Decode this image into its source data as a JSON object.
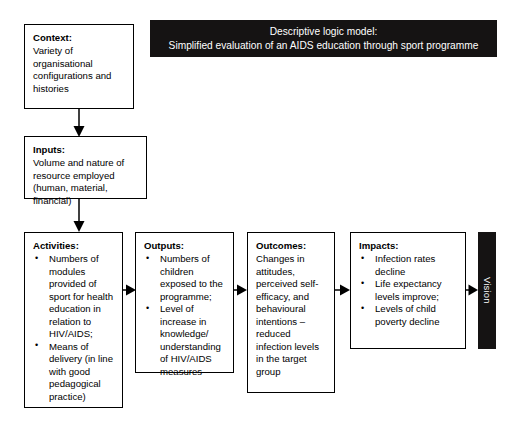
{
  "banner": {
    "line1": "Descriptive logic model:",
    "line2": "Simplified evaluation of an AIDS education through sport programme",
    "background_color": "#151313",
    "text_color": "#ffffff"
  },
  "nodes": {
    "context": {
      "heading": "Context:",
      "body": "Variety of organisational configurations and histories"
    },
    "inputs": {
      "heading": "Inputs:",
      "body": "Volume and nature of resource employed (human, material, financial)"
    },
    "activities": {
      "heading": "Activities:",
      "bullets": [
        "Numbers of modules provided of sport for health education in relation to HIV/AIDS;",
        "Means of delivery (in line with good pedagogical practice)"
      ]
    },
    "outputs": {
      "heading": "Outputs:",
      "bullets": [
        "Numbers of children exposed to the programme;",
        "Level of increase in knowledge/ understanding of HIV/AIDS measures"
      ]
    },
    "outcomes": {
      "heading": "Outcomes:",
      "body": "Changes in attitudes, perceived self-efficacy, and behavioural intentions – reduced infection levels in the target group"
    },
    "impacts": {
      "heading": "Impacts:",
      "bullets": [
        "Infection rates decline",
        "Life expectancy levels improve;",
        "Levels of child poverty decline"
      ]
    },
    "vision": {
      "label": "Vision",
      "background_color": "#151313",
      "text_color": "#ffffff"
    }
  },
  "bullet_glyph": "•",
  "colors": {
    "page_background": "#ffffff",
    "box_border": "#000000",
    "text": "#000000",
    "banner_fill": "#151313"
  }
}
